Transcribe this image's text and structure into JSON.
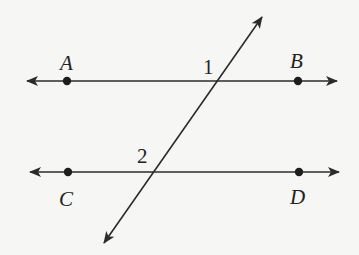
{
  "diagram": {
    "type": "parallel-lines-cut-by-transversal",
    "colors": {
      "background": "#f6f6f4",
      "stroke": "#2b2b2b"
    },
    "lines": [
      {
        "name": "line-AB",
        "from": [
          27,
          81
        ],
        "to": [
          337,
          81
        ],
        "arrows": "both"
      },
      {
        "name": "line-CD",
        "from": [
          30,
          172
        ],
        "to": [
          339,
          172
        ],
        "arrows": "both"
      },
      {
        "name": "transversal",
        "from": [
          104,
          243
        ],
        "to": [
          262,
          17
        ],
        "arrows": "both"
      }
    ],
    "points": [
      {
        "label": "A",
        "x": 67,
        "y": 81
      },
      {
        "label": "B",
        "x": 298,
        "y": 81
      },
      {
        "label": "C",
        "x": 68,
        "y": 172
      },
      {
        "label": "D",
        "x": 299,
        "y": 172
      }
    ],
    "labels": {
      "A": "A",
      "B": "B",
      "C": "C",
      "D": "D",
      "angle1": "1",
      "angle2": "2"
    },
    "angles": [
      {
        "label": "1",
        "at": "intersection of transversal and AB",
        "position": "upper-left"
      },
      {
        "label": "2",
        "at": "intersection of transversal and CD",
        "position": "upper-left"
      }
    ]
  }
}
